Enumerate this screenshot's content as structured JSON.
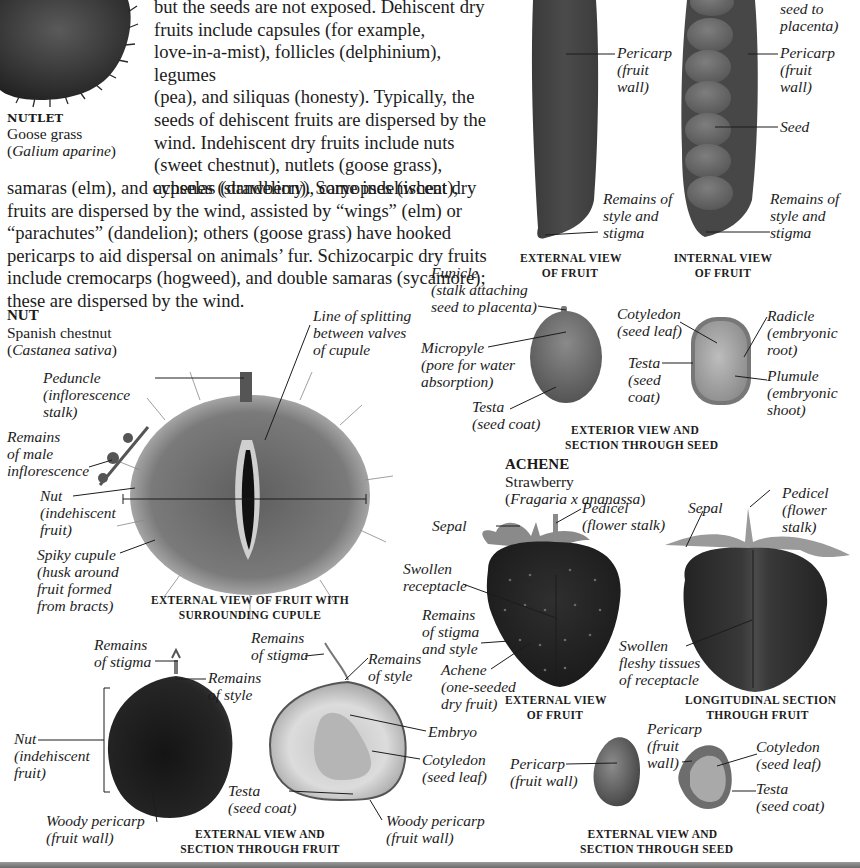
{
  "intro": {
    "lines_narrow": [
      "but the seeds are not exposed. Dehiscent dry",
      "fruits include capsules (for example,",
      "love-in-a-mist), follicles (delphinium), legumes",
      "(pea), and siliquas (honesty). Typically, the",
      "seeds of dehiscent fruits are dispersed by the",
      "wind. Indehiscent dry fruits include nuts",
      "(sweet chestnut), nutlets (goose grass),",
      "achenes (strawberry), caryopses (wheat),"
    ],
    "lines_wide": [
      "samaras (elm), and cypselas (dandelion). Some indehiscent dry",
      "fruits are dispersed by the wind, assisted by “wings” (elm) or",
      "“parachutes” (dandelion); others (goose grass) have hooked",
      "pericarps to aid dispersal on animals’ fur. Schizocarpic dry fruits",
      "include cremocarps (hogweed), and double samaras (sycamore);",
      "these are dispersed by the wind."
    ]
  },
  "nutlet": {
    "type": "NUTLET",
    "common_name": "Goose grass",
    "latin_name": "Galium aparine"
  },
  "legume": {
    "labels": {
      "funicle_tail": "seed to\nplacenta)",
      "pericarp_ext": "Pericarp\n(fruit\nwall)",
      "pericarp_int": "Pericarp\n(fruit\nwall)",
      "seed": "Seed",
      "style_ext": "Remains of\nstyle and\nstigma",
      "style_int": "Remains of\nstyle and\nstigma"
    },
    "captions": {
      "external": "EXTERNAL VIEW\nOF FRUIT",
      "internal": "INTERNAL VIEW\nOF FRUIT"
    }
  },
  "pea_seed": {
    "labels": {
      "funicle": "Funicle\n(stalk attaching\nseed to placenta)",
      "micropyle": "Micropyle\n(pore for water\nabsorption)",
      "testa_ext": "Testa\n(seed coat)",
      "cotyledon": "Cotyledon\n(seed leaf)",
      "testa_sec": "Testa\n(seed\ncoat)",
      "radicle": "Radicle\n(embryonic\nroot)",
      "plumule": "Plumule\n(embryonic\nshoot)"
    },
    "caption": "EXTERIOR VIEW AND\nSECTION THROUGH SEED"
  },
  "nut": {
    "type": "NUT",
    "common_name": "Spanish chestnut",
    "latin_name": "Castanea sativa",
    "labels": {
      "splitting": "Line of splitting\nbetween valves\nof cupule",
      "peduncle": "Peduncle\n(inflorescence\nstalk)",
      "male_inflorescence": "Remains\nof male\ninflorescence",
      "nut": "Nut\n(indehiscent\nfruit)",
      "cupule": "Spiky cupule\n(husk around\nfruit formed\nfrom bracts)"
    },
    "caption": "EXTERNAL VIEW OF FRUIT WITH\nSURROUNDING CUPULE"
  },
  "chestnut_section": {
    "labels": {
      "stigma_left": "Remains\nof stigma",
      "style_left": "Remains\nof style",
      "nut": "Nut\n(indehiscent\nfruit)",
      "pericarp_left": "Woody pericarp\n(fruit wall)",
      "stigma_right": "Remains\nof stigma",
      "style_right": "Remains\nof style",
      "embryo": "Embryo",
      "cotyledon": "Cotyledon\n(seed leaf)",
      "testa": "Testa\n(seed coat)",
      "pericarp_right": "Woody pericarp\n(fruit wall)"
    },
    "caption": "EXTERNAL VIEW AND\nSECTION THROUGH FRUIT"
  },
  "achene": {
    "type": "ACHENE",
    "common_name": "Strawberry",
    "latin_name": "Fragaria x ananassa",
    "labels": {
      "sepal_left": "Sepal",
      "pedicel_left": "Pedicel\n(flower stalk)",
      "receptacle": "Swollen\nreceptacle",
      "stigma_style": "Remains\nof stigma\nand style",
      "achene": "Achene\n(one-seeded\ndry fruit)",
      "sepal_right": "Sepal",
      "pedicel_right": "Pedicel\n(flower\nstalk)",
      "fleshy": "Swollen\nfleshy tissues\nof receptacle"
    },
    "captions": {
      "external": "EXTERNAL VIEW\nOF FRUIT",
      "section": "LONGITUDINAL SECTION\nTHROUGH FRUIT"
    }
  },
  "achene_seed": {
    "labels": {
      "pericarp_ext": "Pericarp\n(fruit wall)",
      "pericarp_sec": "Pericarp\n(fruit\nwall)",
      "cotyledon": "Cotyledon\n(seed leaf)",
      "testa": "Testa\n(seed coat)"
    },
    "caption": "EXTERNAL VIEW AND\nSECTION THROUGH SEED"
  },
  "colors": {
    "text": "#1c1c1c",
    "background": "#ffffff",
    "photo_dark": "#2b2b2b",
    "photo_mid": "#6e6e6e",
    "photo_light": "#c9c9c9"
  }
}
